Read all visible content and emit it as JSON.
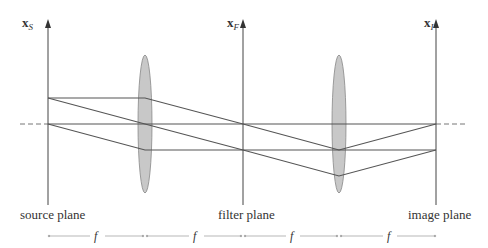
{
  "diagram": {
    "colors": {
      "ray": "#555555",
      "axis": "#555555",
      "lens_fill": "#c8c8c8",
      "lens_stroke": "#888888",
      "dim": "#999999",
      "text": "#333333"
    },
    "planes": [
      {
        "id": "source",
        "axis_label": "x",
        "axis_sub": "S",
        "label": "source plane"
      },
      {
        "id": "filter",
        "axis_label": "x",
        "axis_sub": "F",
        "label": "filter plane"
      },
      {
        "id": "image",
        "axis_label": "x",
        "axis_sub": "I",
        "label": "image plane"
      }
    ],
    "lenses": [
      {
        "id": "lens-1"
      },
      {
        "id": "lens-2"
      }
    ],
    "dimensions": [
      {
        "label": "f"
      },
      {
        "label": "f"
      },
      {
        "label": "f"
      },
      {
        "label": "f"
      }
    ]
  }
}
